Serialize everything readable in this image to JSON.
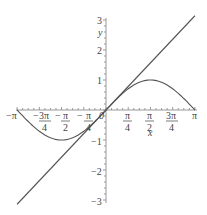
{
  "chart_data": {
    "type": "line",
    "title": "",
    "xlabel": "x",
    "ylabel": "y",
    "xlim": [
      -3.14159,
      3.14159
    ],
    "ylim": [
      -3,
      3
    ],
    "grid": false,
    "legend": null,
    "x_ticks": [
      "-π",
      "-3π/4",
      "-π/2",
      "-π/4",
      "0",
      "π/4",
      "π/2",
      "3π/4",
      "π"
    ],
    "y_ticks": [
      "-3",
      "-2",
      "-1",
      "1",
      "2",
      "3"
    ],
    "series": [
      {
        "name": "y = x",
        "function": "x",
        "color": "#555555",
        "x": [
          -3.1416,
          3.1416
        ],
        "y": [
          -3.1416,
          3.1416
        ]
      },
      {
        "name": "y = sin(x)",
        "function": "sin(x)",
        "color": "#555555",
        "x": [
          -3.1416,
          -2.3562,
          -1.5708,
          -0.7854,
          0,
          0.7854,
          1.5708,
          2.3562,
          3.1416
        ],
        "y": [
          0,
          -0.7071,
          -1,
          -0.7071,
          0,
          0.7071,
          1,
          0.7071,
          0
        ]
      }
    ]
  },
  "axes": {
    "x_label": "x",
    "y_label": "y",
    "y_tick_labels": [
      "3",
      "2",
      "1",
      "−1",
      "−2",
      "−3"
    ],
    "origin_label": "0"
  }
}
